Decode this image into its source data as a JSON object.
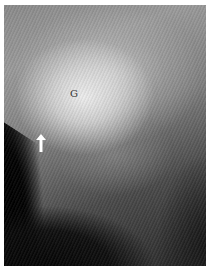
{
  "image": {
    "type": "radiograph",
    "labels": {
      "region_label": "G"
    },
    "annotations": [
      {
        "type": "arrow",
        "direction": "up",
        "color": "#ffffff"
      }
    ],
    "colors": {
      "border": "#ffffff",
      "bright_region": "#e8e8e8",
      "dark_region": "#050505"
    }
  }
}
